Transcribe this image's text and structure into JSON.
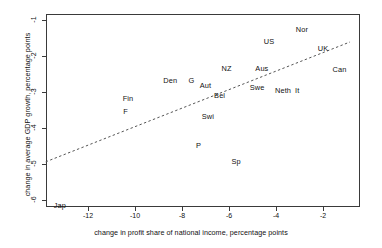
{
  "chart_data": {
    "type": "scatter",
    "title": "",
    "xlabel": "change in profit share of national income, percentage points",
    "ylabel": "change in average GDP growth, percentage points",
    "xlim": [
      -13.8,
      -0.85
    ],
    "ylim": [
      -6.2,
      -0.85
    ],
    "xticks": [
      -12,
      -10,
      -8,
      -6,
      -4,
      -2
    ],
    "xtick_labels": [
      "-12",
      "-10",
      "-8",
      "-6",
      "-4",
      "-2"
    ],
    "yticks": [
      -1,
      -2,
      -3,
      -4,
      -5,
      -6
    ],
    "ytick_labels": [
      "-1",
      "-2",
      "-3",
      "-4",
      "-5",
      "-6"
    ],
    "grid": false,
    "legend": false,
    "marker_style": "text-label-only",
    "points": [
      {
        "label": "Nor",
        "x": -2.9,
        "y": -1.25
      },
      {
        "label": "US",
        "x": -4.3,
        "y": -1.58
      },
      {
        "label": "UK",
        "x": -2.0,
        "y": -1.78
      },
      {
        "label": "Can",
        "x": -1.3,
        "y": -2.36
      },
      {
        "label": "NZ",
        "x": -6.1,
        "y": -2.33
      },
      {
        "label": "Aus",
        "x": -4.6,
        "y": -2.33
      },
      {
        "label": "Den",
        "x": -8.5,
        "y": -2.67
      },
      {
        "label": "G",
        "x": -7.6,
        "y": -2.67
      },
      {
        "label": "Aut",
        "x": -7.0,
        "y": -2.81
      },
      {
        "label": "Swe",
        "x": -4.8,
        "y": -2.86
      },
      {
        "label": "Bel",
        "x": -6.4,
        "y": -3.08
      },
      {
        "label": "Neth",
        "x": -3.7,
        "y": -2.94
      },
      {
        "label": "It",
        "x": -3.1,
        "y": -2.94
      },
      {
        "label": "Fin",
        "x": -10.3,
        "y": -3.17
      },
      {
        "label": "F",
        "x": -10.4,
        "y": -3.53
      },
      {
        "label": "Swi",
        "x": -6.9,
        "y": -3.67
      },
      {
        "label": "P",
        "x": -7.3,
        "y": -4.47
      },
      {
        "label": "Sp",
        "x": -5.7,
        "y": -4.92
      },
      {
        "label": "Jap",
        "x": -13.2,
        "y": -6.14
      }
    ],
    "trendline": {
      "style": "dashed",
      "color": "#555555",
      "x_start": -13.8,
      "y_start": -4.94,
      "x_end": -0.85,
      "y_end": -1.61
    }
  },
  "axes_geometry": {
    "note": "pixel mapping used by template",
    "x_px_at_-12": 88,
    "px_per_x_unit": 23.5,
    "y_px_at_-1": 20,
    "px_per_y_unit": 36
  }
}
